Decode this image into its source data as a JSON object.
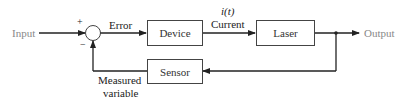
{
  "diagram": {
    "type": "feedback-control-block-diagram",
    "input_label": "Input",
    "output_label": "Output",
    "summing_junction": {
      "plus_sign": "+",
      "minus_sign": "−"
    },
    "signals": {
      "error": "Error",
      "current_symbol": "i(t)",
      "current": "Current",
      "measured_line1": "Measured",
      "measured_line2": "variable"
    },
    "blocks": [
      {
        "id": "device",
        "label": "Device"
      },
      {
        "id": "laser",
        "label": "Laser"
      },
      {
        "id": "sensor",
        "label": "Sensor"
      }
    ],
    "colors": {
      "line": "#222222",
      "box_border": "#444444",
      "io_text": "#888888",
      "text": "#222222"
    }
  }
}
